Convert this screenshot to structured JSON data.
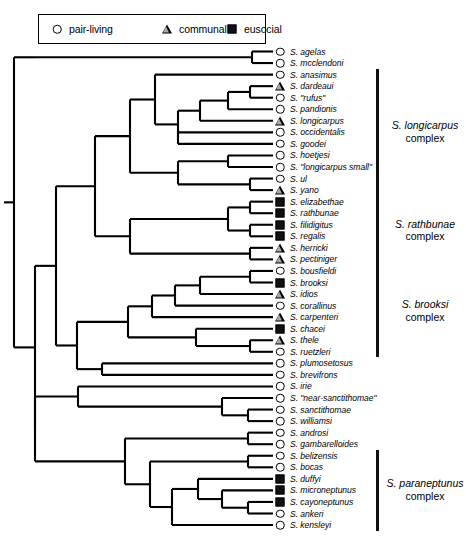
{
  "legend": {
    "items": [
      {
        "icon": "open-circle-icon",
        "symbol": "circle",
        "label": "pair-living"
      },
      {
        "icon": "triangle-icon",
        "symbol": "triangle",
        "label": "communal"
      },
      {
        "icon": "filled-square-icon",
        "symbol": "square",
        "label": "eusocial"
      }
    ]
  },
  "chart_data": {
    "type": "tree",
    "title": "",
    "subtitle": "",
    "xlabel": "",
    "ylabel": "",
    "legend_position": "top-left",
    "grid": false,
    "symbol_meaning": {
      "circle": "pair-living",
      "triangle": "communal",
      "square": "eusocial"
    },
    "taxa": [
      {
        "index": 0,
        "name": "S. agelas",
        "symbol": "circle"
      },
      {
        "index": 1,
        "name": "S. mcclendoni",
        "symbol": "circle"
      },
      {
        "index": 2,
        "name": "S. anasimus",
        "symbol": "circle"
      },
      {
        "index": 3,
        "name": "S. dardeaui",
        "symbol": "triangle"
      },
      {
        "index": 4,
        "name": "S. \"rufus\"",
        "symbol": "circle"
      },
      {
        "index": 5,
        "name": "S. pandionis",
        "symbol": "circle"
      },
      {
        "index": 6,
        "name": "S. longicarpus",
        "symbol": "triangle"
      },
      {
        "index": 7,
        "name": "S. occidentalis",
        "symbol": "circle"
      },
      {
        "index": 8,
        "name": "S. goodei",
        "symbol": "circle"
      },
      {
        "index": 9,
        "name": "S. hoetjesi",
        "symbol": "circle"
      },
      {
        "index": 10,
        "name": "S. \"longicarpus small\"",
        "symbol": "circle"
      },
      {
        "index": 11,
        "name": "S. ul",
        "symbol": "circle"
      },
      {
        "index": 12,
        "name": "S. yano",
        "symbol": "triangle"
      },
      {
        "index": 13,
        "name": "S. elizabethae",
        "symbol": "square"
      },
      {
        "index": 14,
        "name": "S. rathbunae",
        "symbol": "square"
      },
      {
        "index": 15,
        "name": "S. filidigitus",
        "symbol": "square"
      },
      {
        "index": 16,
        "name": "S. regalis",
        "symbol": "square"
      },
      {
        "index": 17,
        "name": "S. herricki",
        "symbol": "triangle"
      },
      {
        "index": 18,
        "name": "S. pectiniger",
        "symbol": "triangle"
      },
      {
        "index": 19,
        "name": "S. bousfieldi",
        "symbol": "circle"
      },
      {
        "index": 20,
        "name": "S. brooksi",
        "symbol": "square"
      },
      {
        "index": 21,
        "name": "S. idios",
        "symbol": "triangle"
      },
      {
        "index": 22,
        "name": "S. corallinus",
        "symbol": "circle"
      },
      {
        "index": 23,
        "name": "S. carpenteri",
        "symbol": "triangle"
      },
      {
        "index": 24,
        "name": "S. chacei",
        "symbol": "square"
      },
      {
        "index": 25,
        "name": "S. thele",
        "symbol": "triangle"
      },
      {
        "index": 26,
        "name": "S. ruetzleri",
        "symbol": "circle"
      },
      {
        "index": 27,
        "name": "S. plumosetosus",
        "symbol": "circle"
      },
      {
        "index": 28,
        "name": "S. brevifrons",
        "symbol": "circle"
      },
      {
        "index": 29,
        "name": "S. irie",
        "symbol": "circle"
      },
      {
        "index": 30,
        "name": "S. \"near-sanctithomae\"",
        "symbol": "circle"
      },
      {
        "index": 31,
        "name": "S. sanctithomae",
        "symbol": "circle"
      },
      {
        "index": 32,
        "name": "S. williamsi",
        "symbol": "circle"
      },
      {
        "index": 33,
        "name": "S. androsi",
        "symbol": "circle"
      },
      {
        "index": 34,
        "name": "S. gambarelloides",
        "symbol": "circle"
      },
      {
        "index": 35,
        "name": "S. belizensis",
        "symbol": "circle"
      },
      {
        "index": 36,
        "name": "S. bocas",
        "symbol": "circle"
      },
      {
        "index": 37,
        "name": "S. duffyi",
        "symbol": "square"
      },
      {
        "index": 38,
        "name": "S. microneptunus",
        "symbol": "square"
      },
      {
        "index": 39,
        "name": "S. cayoneptunus",
        "symbol": "square"
      },
      {
        "index": 40,
        "name": "S. ankeri",
        "symbol": "circle"
      },
      {
        "index": 41,
        "name": "S. kensleyi",
        "symbol": "circle"
      }
    ],
    "complexes": [
      {
        "species": "S. longicarpus",
        "word": "complex",
        "first_index": 2,
        "last_index": 12
      },
      {
        "species": "S. rathbunae",
        "word": "complex",
        "first_index": 13,
        "last_index": 18
      },
      {
        "species": "S. brooksi",
        "word": "complex",
        "first_index": 19,
        "last_index": 26
      },
      {
        "species": "S. paraneptunus",
        "word": "complex",
        "first_index": 35,
        "last_index": 41
      }
    ]
  }
}
